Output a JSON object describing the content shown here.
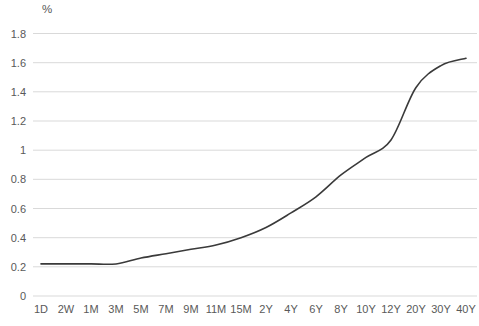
{
  "chart_data": {
    "type": "line",
    "title": "",
    "xlabel": "",
    "ylabel": "%",
    "categories": [
      "1D",
      "2W",
      "1M",
      "3M",
      "5M",
      "7M",
      "9M",
      "11M",
      "15M",
      "2Y",
      "4Y",
      "6Y",
      "8Y",
      "10Y",
      "12Y",
      "20Y",
      "30Y",
      "40Y"
    ],
    "series": [
      {
        "name": "yield-curve",
        "values": [
          0.22,
          0.22,
          0.22,
          0.22,
          0.26,
          0.29,
          0.32,
          0.35,
          0.4,
          0.47,
          0.57,
          0.68,
          0.83,
          0.95,
          1.07,
          1.43,
          1.58,
          1.63
        ]
      }
    ],
    "ylim": [
      0,
      1.8
    ],
    "y_ticks": [
      0,
      0.2,
      0.4,
      0.6,
      0.8,
      1,
      1.2,
      1.4,
      1.6,
      1.8
    ],
    "y_tick_labels": [
      "0",
      "0.2",
      "0.4",
      "0.6",
      "0.8",
      "1",
      "1.2",
      "1.4",
      "1.6",
      "1.8"
    ],
    "grid": "horizontal",
    "legend": "none",
    "colors": {
      "line": "#3a3a3a",
      "gridline": "#d9d9d9",
      "tick_label": "#595959",
      "background": "#ffffff"
    }
  }
}
